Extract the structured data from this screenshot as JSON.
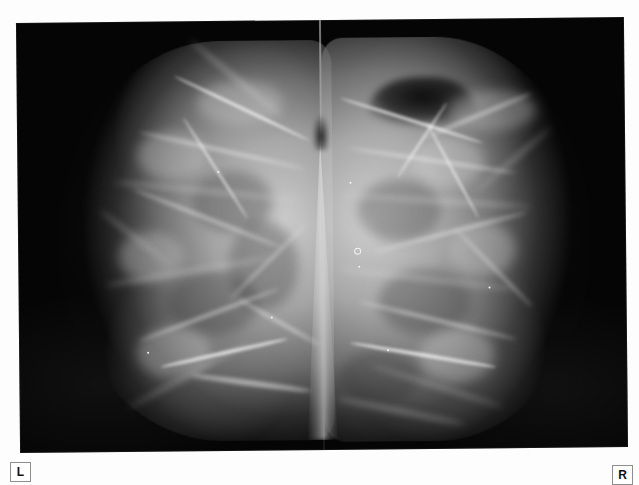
{
  "study": {
    "modality_label": "mammogram",
    "view_description": "bilateral craniocaudal mammogram, two films mounted side by side",
    "background_color": "#fdfdfd",
    "film_color": "#050505",
    "tissue_color": "#d6d6d6"
  },
  "markers": [
    {
      "name": "laterality-left",
      "label": "L",
      "position": "bottom-left",
      "text_color": "#111111",
      "border_color": "#8e8e8e",
      "fill_color": "#ffffff"
    },
    {
      "name": "laterality-right",
      "label": "R",
      "position": "bottom-right",
      "text_color": "#111111",
      "border_color": "#8e8e8e",
      "fill_color": "#ffffff"
    }
  ],
  "film": {
    "left_panel_name": "left-breast-film-panel",
    "right_panel_name": "right-breast-film-panel",
    "seam_name": "film-centre-seam"
  },
  "annotations": {
    "axilla_note": "dark axillary notch upper right",
    "calcification_note": "scattered punctate densities"
  }
}
